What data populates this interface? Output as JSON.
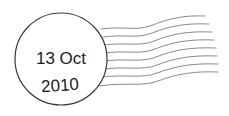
{
  "postmark": {
    "date_line1": "13 Oct",
    "date_line2": "2010",
    "ink_color": "#3a3a3a",
    "wave_color": "#8a8a8a",
    "wave_count": 8
  }
}
